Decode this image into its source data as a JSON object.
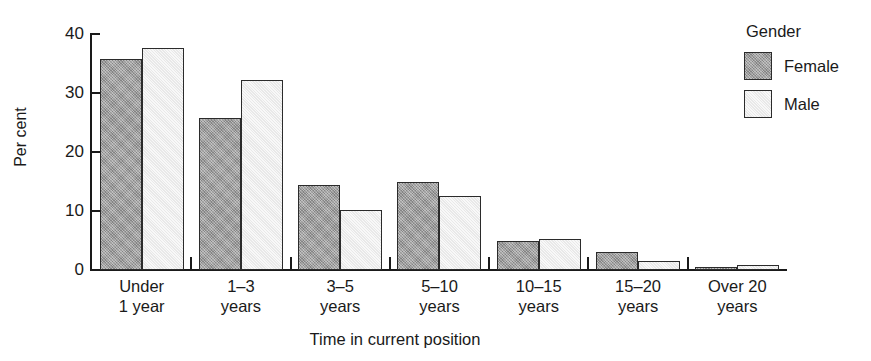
{
  "chart_data": {
    "type": "bar",
    "title": "",
    "xlabel": "Time in current position",
    "ylabel": "Per cent",
    "ylim": [
      0,
      40
    ],
    "yticks": [
      0,
      10,
      20,
      30,
      40
    ],
    "grid": false,
    "legend": {
      "title": "Gender",
      "position": "right",
      "entries": [
        {
          "name": "Female",
          "color": "#9e9e9e"
        },
        {
          "name": "Male",
          "color": "#f1f1f1"
        }
      ]
    },
    "categories": [
      "Under 1 year",
      "1–3 years",
      "3–5 years",
      "5–10 years",
      "10–15 years",
      "15–20 years",
      "Over 20 years"
    ],
    "category_lines": [
      [
        "Under",
        "1 year"
      ],
      [
        "1–3",
        "years"
      ],
      [
        "3–5",
        "years"
      ],
      [
        "5–10",
        "years"
      ],
      [
        "10–15",
        "years"
      ],
      [
        "15–20",
        "years"
      ],
      [
        "Over 20",
        "years"
      ]
    ],
    "series": [
      {
        "name": "Female",
        "color": "#9e9e9e",
        "values": [
          35.8,
          25.8,
          14.4,
          15.0,
          5.0,
          3.1,
          0.5
        ]
      },
      {
        "name": "Male",
        "color": "#f1f1f1",
        "values": [
          37.7,
          32.2,
          10.2,
          12.5,
          5.3,
          1.5,
          0.9
        ]
      }
    ]
  },
  "axes": {
    "y_tick_labels": [
      "0",
      "10",
      "20",
      "30",
      "40"
    ],
    "y_axis_label": "Per cent",
    "x_axis_label": "Time in current position"
  },
  "legend": {
    "title": "Gender",
    "female_label": "Female",
    "male_label": "Male"
  }
}
